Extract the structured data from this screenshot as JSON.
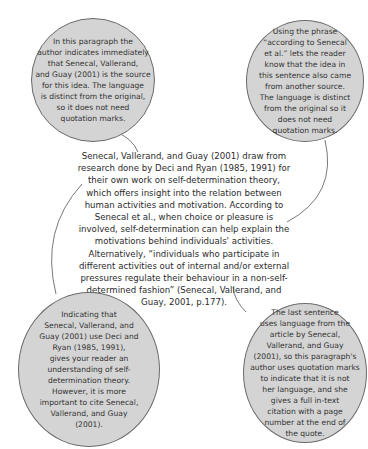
{
  "main_paragraph": {
    "lines": [
      "Senecal, Vallerand, and Guay (2001) draw from",
      "research done by Deci and Ryan (1985, 1991) for",
      "their own work on self-determination theory,",
      "which offers insight into the relation between",
      "human activities and motivation. According to",
      "Senecal et al., when choice or pleasure is",
      "involved, self-determination can help explain the",
      "motivations behind individuals' activities.",
      "Alternatively, “individuals who participate in",
      "different activities out of internal and/or external",
      "pressures regulate their behaviour in a non-self-",
      "determined fashion” (Senecal, Vallerand, and",
      "Guay, 2001, p.177)."
    ]
  },
  "annotations": {
    "top_left": {
      "lines": [
        "In this paragraph the",
        "author indicates immediately",
        "that Senecal, Vallerand,",
        "and Guay (2001) is the source",
        "for this idea. The language",
        "is distinct from the original,",
        "so it does not need",
        "quotation marks."
      ]
    },
    "top_right": {
      "lines": [
        "Using the phrase",
        "“according to Senecal",
        "et al.” lets the reader",
        "know that the idea in",
        "this sentence also came",
        "from another source.",
        "The language is distinct",
        "from the original so it",
        "does not need",
        "quotation marks."
      ]
    },
    "bottom_left": {
      "lines": [
        "Indicating that",
        "Senecal, Vallerand, and",
        "Guay (2001) use Deci and",
        "Ryan (1985, 1991),",
        "gives your reader an",
        "understanding of self-",
        "determination theory.",
        "However, it is more",
        "important to cite Senecal,",
        "Vallerand, and Guay",
        "(2001)."
      ]
    },
    "bottom_right": {
      "lines": [
        "The last sentence",
        "uses language from the",
        "article by Senecal,",
        "Vallerand, and Guay",
        "(2001), so this paragraph's",
        "author uses quotation marks",
        "to indicate that it is not",
        "her language, and she",
        "gives a full in-text",
        "citation with a page",
        "number at the end of",
        "the quote."
      ]
    }
  },
  "colors": {
    "bubble_fill": "#d4d4d4",
    "bubble_border": "#6b6b6b",
    "connector": "#555555",
    "text": "#2b2b2b"
  }
}
